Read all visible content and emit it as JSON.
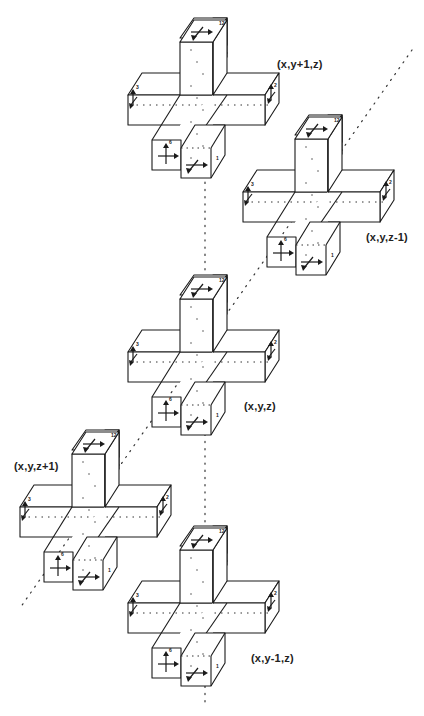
{
  "diagram": {
    "type": "3D polycube cross neighborhood",
    "crosses": [
      {
        "id": "cross-y-plus",
        "label": "(x,y+1,z)"
      },
      {
        "id": "cross-z-minus",
        "label": "(x,y,z-1)"
      },
      {
        "id": "cross-center",
        "label": "(x,y,z)"
      },
      {
        "id": "cross-z-plus",
        "label": "(x,y,z+1)"
      },
      {
        "id": "cross-y-minus",
        "label": "(x,y-1,z)"
      }
    ],
    "face_numbers": [
      "12",
      "4",
      "3",
      "2",
      "6",
      "1"
    ],
    "axes": [
      {
        "id": "y-axis",
        "style": "dotted",
        "direction": "vertical"
      },
      {
        "id": "z-axis",
        "style": "dotted",
        "direction": "diagonal"
      }
    ],
    "colors": {
      "stroke": "#1a1a1a",
      "background": "#ffffff",
      "dots": "#333333"
    }
  }
}
